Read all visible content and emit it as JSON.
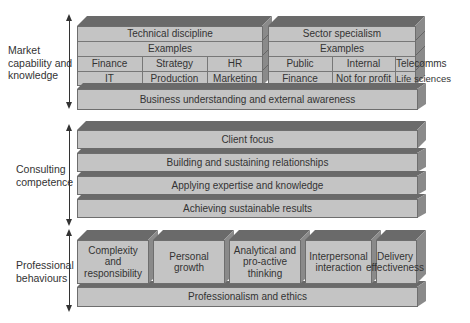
{
  "sections": {
    "market": {
      "label": "Market capability and knowledge",
      "technical": {
        "title": "Technical discipline",
        "examples_label": "Examples",
        "row1": [
          "Finance",
          "Strategy",
          "HR"
        ],
        "row2": [
          "IT",
          "Production",
          "Marketing"
        ]
      },
      "sector": {
        "title": "Sector specialism",
        "examples_label": "Examples",
        "row1": [
          "Public",
          "Internal",
          "Telecomms"
        ],
        "row2": [
          "Finance",
          "Not for profit",
          "Life sciences"
        ]
      },
      "base": "Business understanding and external awareness"
    },
    "consulting": {
      "label": "Consulting competence",
      "layers": [
        "Client focus",
        "Building and sustaining relationships",
        "Applying expertise and knowledge",
        "Achieving sustainable results"
      ]
    },
    "professional": {
      "label": "Professional behaviours",
      "boxes": [
        "Complexity and responsibility",
        "Personal growth",
        "Analytical and pro-active thinking",
        "Interpersonal interaction",
        "Delivery effectiveness"
      ],
      "base": "Professionalism and ethics"
    }
  },
  "colors": {
    "front": "#c4c4c4",
    "top": "#6a6a6a",
    "side": "#8a8a8a"
  }
}
